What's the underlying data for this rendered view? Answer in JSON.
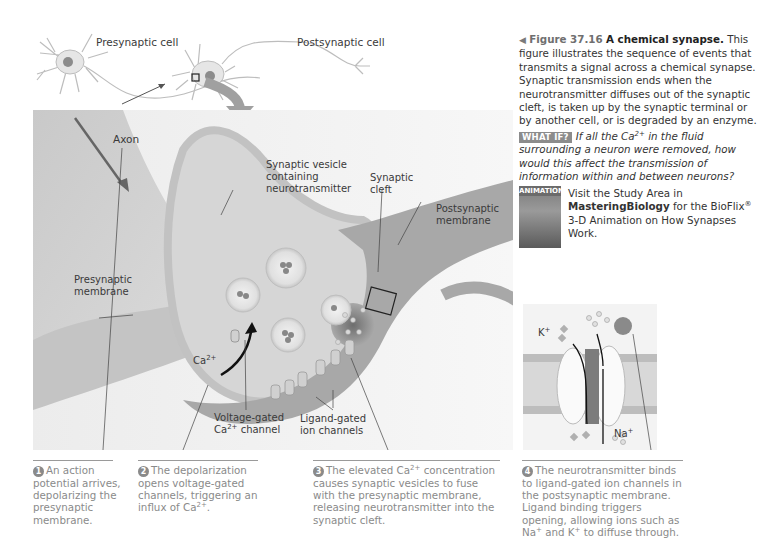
{
  "figure": {
    "number": "Figure 37.16",
    "title": "A chemical synapse.",
    "caption": "This figure illustrates the sequence of events that transmits a signal across a chemical synapse. Synaptic transmission ends when the neurotransmitter diffuses out of the synaptic cleft, is taken up by the synaptic terminal or by another cell, or is degraded by an enzyme."
  },
  "what_if": {
    "badge": "WHAT IF?",
    "question_pre": "If all the Ca",
    "question_sup": "2+",
    "question_post": " in the fluid surrounding a neuron were removed, how would this affect the transmission of information within and between neurons?"
  },
  "animation": {
    "badge": "ANIMATION",
    "text_pre": "Visit the Study Area in ",
    "text_bold": "MasteringBiology",
    "text_mid": " for the BioFlix",
    "text_reg": "®",
    "text_post": " 3-D Animation on How Synapses Work."
  },
  "labels": {
    "presynaptic_cell": "Presynaptic cell",
    "postsynaptic_cell": "Postsynaptic cell",
    "axon": "Axon",
    "synaptic_vesicle": "Synaptic vesicle\ncontaining\nneurotransmitter",
    "synaptic_cleft": "Synaptic\ncleft",
    "postsynaptic_membrane": "Postsynaptic\nmembrane",
    "presynaptic_membrane": "Presynaptic\nmembrane",
    "ca_ion": "Ca",
    "ca_ion_sup": "2+",
    "voltage_gated_line1": "Voltage-gated",
    "voltage_gated_line2_pre": "Ca",
    "voltage_gated_line2_sup": "2+",
    "voltage_gated_line2_post": " channel",
    "ligand_gated": "Ligand-gated\nion channels",
    "k_ion": "K",
    "k_ion_sup": "+",
    "na_ion": "Na",
    "na_ion_sup": "+"
  },
  "steps": [
    {
      "num": "1",
      "text": "An action potential arrives, depolarizing the presynaptic membrane."
    },
    {
      "num": "2",
      "text_pre": "The depolarization opens voltage-gated channels, triggering an influx of Ca",
      "sup": "2+",
      "text_post": "."
    },
    {
      "num": "3",
      "text_pre": "The elevated Ca",
      "sup": "2+",
      "text_post": " concentration causes synaptic vesicles to fuse with the presynaptic membrane, releasing neurotransmitter into the synaptic cleft."
    },
    {
      "num": "4",
      "text_pre": "The neurotransmitter binds to ligand-gated ion channels in the postsynaptic membrane. Ligand binding triggers opening, allowing ions such as Na",
      "sup": "+",
      "text_mid": " and K",
      "sup2": "+",
      "text_post": " to diffuse through."
    }
  ],
  "colors": {
    "tissue_light": "#d9d9d9",
    "tissue_mid": "#bdbdbd",
    "tissue_dark": "#8f8f8f",
    "step_text": "#8a8a8a",
    "badge_gray": "#8c8c8c"
  }
}
